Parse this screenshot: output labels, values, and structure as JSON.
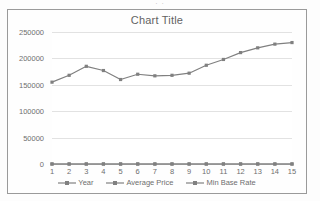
{
  "top_crop_text": "· ·",
  "chart": {
    "title": "Chart Title",
    "y_ticks": [
      "0",
      "50000",
      "100000",
      "150000",
      "200000",
      "250000"
    ],
    "x_ticks": [
      "1",
      "2",
      "3",
      "4",
      "5",
      "6",
      "7",
      "8",
      "9",
      "10",
      "11",
      "12",
      "13",
      "14",
      "15"
    ],
    "legend": [
      {
        "label": "Year",
        "color": "#808080"
      },
      {
        "label": "Average Price",
        "color": "#808080"
      },
      {
        "label": "Min Base Rate",
        "color": "#808080"
      }
    ]
  },
  "chart_data": {
    "type": "line",
    "title": "Chart Title",
    "xlabel": "",
    "ylabel": "",
    "x": [
      1,
      2,
      3,
      4,
      5,
      6,
      7,
      8,
      9,
      10,
      11,
      12,
      13,
      14,
      15
    ],
    "categories": [
      "1",
      "2",
      "3",
      "4",
      "5",
      "6",
      "7",
      "8",
      "9",
      "10",
      "11",
      "12",
      "13",
      "14",
      "15"
    ],
    "ylim": [
      0,
      250000
    ],
    "ytick_values": [
      0,
      50000,
      100000,
      150000,
      200000,
      250000
    ],
    "grid": true,
    "legend_position": "bottom",
    "series": [
      {
        "name": "Year",
        "color": "#808080",
        "marker": "square",
        "values": [
          1,
          2,
          3,
          4,
          5,
          6,
          7,
          8,
          9,
          10,
          11,
          12,
          13,
          14,
          15
        ]
      },
      {
        "name": "Average Price",
        "color": "#808080",
        "marker": "square",
        "values": [
          155000,
          168000,
          185000,
          177000,
          160000,
          170000,
          167000,
          168000,
          172000,
          187000,
          198000,
          211000,
          220000,
          227000,
          230000
        ]
      },
      {
        "name": "Min Base Rate",
        "color": "#808080",
        "marker": "square",
        "values": [
          0,
          0,
          0,
          0,
          0,
          0,
          0,
          0,
          0,
          0,
          0,
          0,
          0,
          0,
          0
        ]
      }
    ]
  }
}
